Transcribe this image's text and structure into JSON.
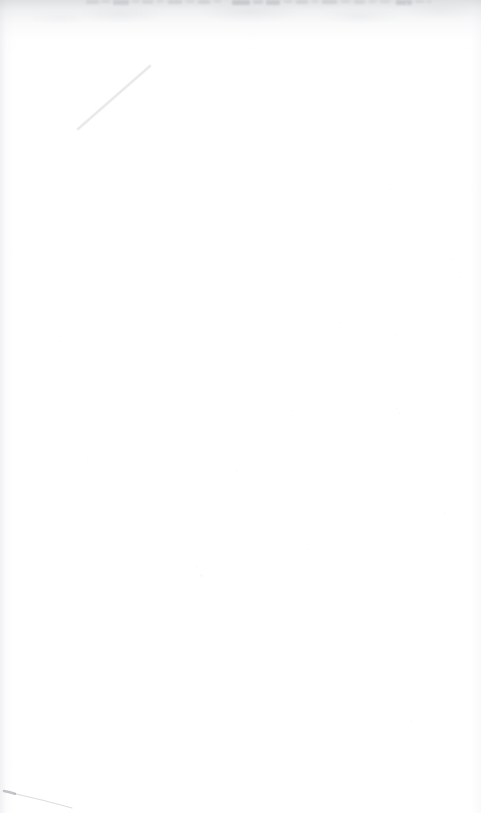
{
  "document": {
    "kind": "scanned-page",
    "page_label": "",
    "body_text": "",
    "description": "Blank scanned document page",
    "width_px": 481,
    "height_px": 813
  },
  "colors": {
    "paper": "#ffffff",
    "top_wash": "#c4c6ca",
    "clipped_text": "#9a9da3",
    "crease": "#d9dadd",
    "pen_ink": "#8d9096",
    "speck": "#e2e3e6",
    "edge_shadow": "#e4e5e8"
  },
  "artifacts": {
    "top_clipped_line": {
      "name": "clipped-text-line",
      "note": "Bottom sliver of a cut-off line of text at the very top edge; illegible.",
      "left_px": 85,
      "right_px": 432,
      "height_px": 7,
      "fragments": [
        {
          "x": 86,
          "w": 13,
          "h": 4,
          "o": 0.22
        },
        {
          "x": 101,
          "w": 9,
          "h": 3,
          "o": 0.18
        },
        {
          "x": 113,
          "w": 16,
          "h": 5,
          "o": 0.3
        },
        {
          "x": 132,
          "w": 7,
          "h": 3,
          "o": 0.16
        },
        {
          "x": 142,
          "w": 11,
          "h": 4,
          "o": 0.2
        },
        {
          "x": 157,
          "w": 6,
          "h": 3,
          "o": 0.14
        },
        {
          "x": 168,
          "w": 14,
          "h": 4,
          "o": 0.24
        },
        {
          "x": 186,
          "w": 8,
          "h": 3,
          "o": 0.17
        },
        {
          "x": 198,
          "w": 12,
          "h": 4,
          "o": 0.22
        },
        {
          "x": 214,
          "w": 7,
          "h": 3,
          "o": 0.15
        },
        {
          "x": 232,
          "w": 18,
          "h": 5,
          "o": 0.36
        },
        {
          "x": 253,
          "w": 10,
          "h": 4,
          "o": 0.26
        },
        {
          "x": 266,
          "w": 14,
          "h": 5,
          "o": 0.32
        },
        {
          "x": 284,
          "w": 8,
          "h": 3,
          "o": 0.18
        },
        {
          "x": 296,
          "w": 12,
          "h": 4,
          "o": 0.22
        },
        {
          "x": 312,
          "w": 6,
          "h": 3,
          "o": 0.14
        },
        {
          "x": 322,
          "w": 15,
          "h": 4,
          "o": 0.25
        },
        {
          "x": 341,
          "w": 9,
          "h": 3,
          "o": 0.17
        },
        {
          "x": 354,
          "w": 11,
          "h": 4,
          "o": 0.2
        },
        {
          "x": 369,
          "w": 7,
          "h": 3,
          "o": 0.14
        },
        {
          "x": 380,
          "w": 10,
          "h": 3,
          "o": 0.16
        },
        {
          "x": 396,
          "w": 16,
          "h": 5,
          "o": 0.34
        },
        {
          "x": 415,
          "w": 9,
          "h": 3,
          "o": 0.18
        },
        {
          "x": 426,
          "w": 6,
          "h": 3,
          "o": 0.13
        }
      ]
    },
    "crease": {
      "name": "diagonal-crease",
      "note": "Faint diagonal fold/scratch in the upper-left quadrant.",
      "x1": 150,
      "y1": 66,
      "x2": 78,
      "y2": 129
    },
    "pen_stroke": {
      "name": "pen-stroke",
      "note": "Faint tapering pen mark in the bottom-left corner.",
      "x1": 4,
      "y1": 791,
      "x2": 72,
      "y2": 808
    },
    "specks": [
      {
        "x": 338,
        "y": 322,
        "d": 2.0,
        "o": 0.16
      },
      {
        "x": 292,
        "y": 410,
        "d": 2.4,
        "o": 0.14
      },
      {
        "x": 452,
        "y": 258,
        "d": 1.8,
        "o": 0.15
      },
      {
        "x": 459,
        "y": 276,
        "d": 1.6,
        "o": 0.12
      },
      {
        "x": 389,
        "y": 188,
        "d": 2.2,
        "o": 0.13
      },
      {
        "x": 471,
        "y": 186,
        "d": 2.0,
        "o": 0.14
      },
      {
        "x": 398,
        "y": 412,
        "d": 1.7,
        "o": 0.12
      },
      {
        "x": 396,
        "y": 333,
        "d": 1.5,
        "o": 0.11
      },
      {
        "x": 396,
        "y": 408,
        "d": 1.8,
        "o": 0.13
      },
      {
        "x": 200,
        "y": 574,
        "d": 2.6,
        "o": 0.17
      },
      {
        "x": 196,
        "y": 566,
        "d": 1.6,
        "o": 0.12
      },
      {
        "x": 236,
        "y": 470,
        "d": 1.8,
        "o": 0.12
      },
      {
        "x": 120,
        "y": 620,
        "d": 1.9,
        "o": 0.11
      },
      {
        "x": 352,
        "y": 653,
        "d": 2.1,
        "o": 0.12
      },
      {
        "x": 306,
        "y": 548,
        "d": 1.7,
        "o": 0.1
      },
      {
        "x": 168,
        "y": 239,
        "d": 2.0,
        "o": 0.12
      },
      {
        "x": 86,
        "y": 458,
        "d": 1.8,
        "o": 0.11
      },
      {
        "x": 444,
        "y": 512,
        "d": 1.6,
        "o": 0.1
      },
      {
        "x": 262,
        "y": 700,
        "d": 1.9,
        "o": 0.11
      },
      {
        "x": 410,
        "y": 720,
        "d": 1.7,
        "o": 0.1
      },
      {
        "x": 60,
        "y": 340,
        "d": 1.6,
        "o": 0.1
      },
      {
        "x": 405,
        "y": 2,
        "d": 3.0,
        "o": 0.34
      }
    ]
  }
}
